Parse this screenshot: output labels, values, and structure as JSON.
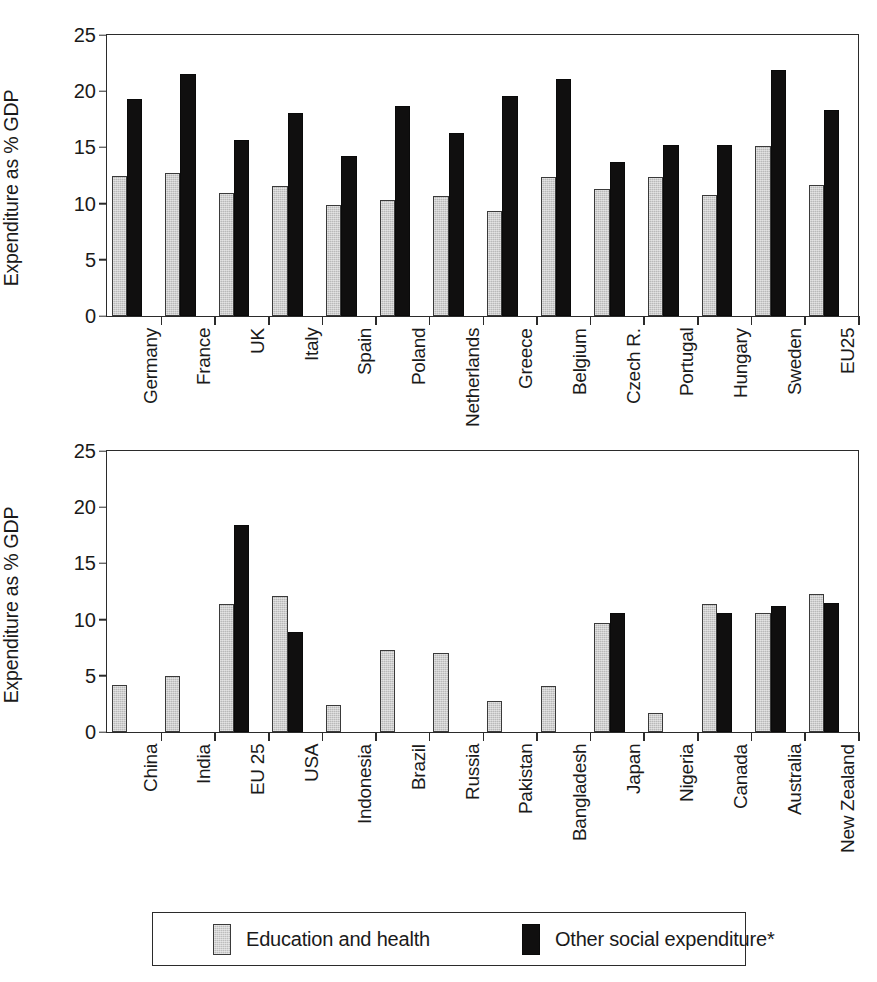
{
  "legend": {
    "items": [
      {
        "key": "education_health",
        "label": "Education and health",
        "color": "#bdbdbd"
      },
      {
        "key": "other_social",
        "label": "Other social expenditure*",
        "color": "#100f0f"
      }
    ]
  },
  "chart_data": [
    {
      "id": "panel-top",
      "type": "bar",
      "title": "",
      "xlabel": "",
      "ylabel": "Expenditure as % GDP",
      "ylim": [
        0,
        25
      ],
      "yticks": [
        0,
        5,
        10,
        15,
        20,
        25
      ],
      "grid": false,
      "legend_position": "bottom",
      "categories": [
        "Germany",
        "France",
        "UK",
        "Italy",
        "Spain",
        "Poland",
        "Netherlands",
        "Greece",
        "Belgium",
        "Czech R.",
        "Portugal",
        "Hungary",
        "Sweden",
        "EU25"
      ],
      "series": [
        {
          "name": "Education and health",
          "color": "#bdbdbd",
          "values": [
            12.5,
            12.7,
            10.9,
            11.6,
            9.9,
            10.3,
            10.7,
            9.3,
            12.4,
            11.3,
            12.4,
            10.8,
            15.1,
            11.7
          ]
        },
        {
          "name": "Other social expenditure*",
          "color": "#100f0f",
          "values": [
            19.3,
            21.5,
            15.7,
            18.1,
            14.2,
            18.7,
            16.3,
            19.6,
            21.1,
            13.7,
            15.2,
            15.2,
            21.9,
            18.3
          ]
        }
      ]
    },
    {
      "id": "panel-bottom",
      "type": "bar",
      "title": "",
      "xlabel": "",
      "ylabel": "Expenditure as % GDP",
      "ylim": [
        0,
        25
      ],
      "yticks": [
        0,
        5,
        10,
        15,
        20,
        25
      ],
      "grid": false,
      "legend_position": "bottom",
      "categories": [
        "China",
        "India",
        "EU 25",
        "USA",
        "Indonesia",
        "Brazil",
        "Russia",
        "Pakistan",
        "Bangladesh",
        "Japan",
        "Nigeria",
        "Canada",
        "Australia",
        "New Zealand"
      ],
      "series": [
        {
          "name": "Education and health",
          "color": "#bdbdbd",
          "values": [
            4.2,
            5.0,
            11.4,
            12.1,
            2.4,
            7.3,
            7.0,
            2.8,
            4.1,
            9.7,
            1.7,
            11.4,
            10.6,
            12.3
          ]
        },
        {
          "name": "Other social expenditure*",
          "color": "#100f0f",
          "values": [
            0,
            0,
            18.4,
            8.9,
            0,
            0,
            0,
            0,
            0,
            10.6,
            0,
            10.6,
            11.2,
            11.5
          ]
        }
      ]
    }
  ]
}
